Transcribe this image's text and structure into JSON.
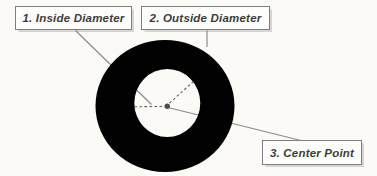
{
  "diagram": {
    "labels": [
      {
        "text": "1. Inside Diameter"
      },
      {
        "text": "2. Outside Diameter"
      },
      {
        "text": "3. Center Point"
      }
    ],
    "colors": {
      "background": "#fbfaf7",
      "ring": "#010101",
      "leader_line": "#8b8b8b",
      "dashed_line": "#5f5f5f",
      "center_dot": "#4c4c4c",
      "box_border": "#7f7f7f",
      "box_background": "#fdfdfb",
      "label_text": "#3b3b3b"
    }
  }
}
